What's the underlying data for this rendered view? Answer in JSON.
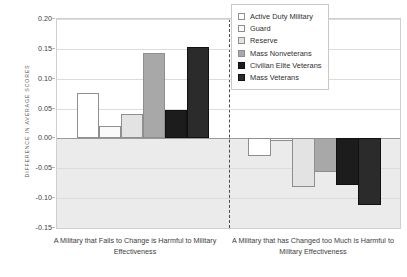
{
  "chart_data": {
    "type": "bar",
    "title": "",
    "subtitle": "",
    "xlabel": "",
    "ylabel": "DIFFERENCE IN AVERAGE SCORES",
    "ylim": [
      -0.15,
      0.2
    ],
    "yticks": [
      0.2,
      0.15,
      0.1,
      0.05,
      0.0,
      -0.05,
      -0.1,
      -0.15
    ],
    "ytick_labels": [
      "0.20",
      "0.15",
      "0.10",
      "0.05",
      "0.00",
      "-0.05",
      "-0.10",
      "-0.15"
    ],
    "grid": true,
    "grid_axis": "y",
    "legend_position": "top-right",
    "panel_divider": "dashed vertical line",
    "categories": [
      "A Military that Fails to Change is Harmful to Military Effectiveness",
      "A Military that has Changed too Much is Harmful to Military Effectiveness"
    ],
    "series": [
      {
        "name": "Active Duty Military",
        "color": "#ffffff",
        "values": [
          0.076,
          -0.029
        ]
      },
      {
        "name": "Guard",
        "color": "#fafafa",
        "values": [
          0.021,
          -0.005
        ]
      },
      {
        "name": "Reserve",
        "color": "#e3e3e3",
        "values": [
          0.041,
          -0.081
        ]
      },
      {
        "name": "Mass Nonveterans",
        "color": "#a8a8a8",
        "values": [
          0.143,
          -0.056
        ]
      },
      {
        "name": "Civilian Elite Veterans",
        "color": "#1c1c1c",
        "values": [
          0.048,
          -0.078
        ]
      },
      {
        "name": "Mass Veterans",
        "color": "#2b2b2b",
        "values": [
          0.153,
          -0.112
        ]
      }
    ]
  },
  "legend": {
    "entries": [
      {
        "label": "Active Duty Military"
      },
      {
        "label": "Guard"
      },
      {
        "label": "Reserve"
      },
      {
        "label": "Mass Nonveterans"
      },
      {
        "label": "Civilian Elite Veterans"
      },
      {
        "label": "Mass Veterans"
      }
    ]
  },
  "axis": {
    "y_title": "DIFFERENCE IN AVERAGE SCORES"
  },
  "captions": {
    "left": "A Military that Fails to Change is Harmful to Military Effectiveness",
    "right": "A Military that has Changed too Much is Harmful to Military Effectiveness"
  }
}
